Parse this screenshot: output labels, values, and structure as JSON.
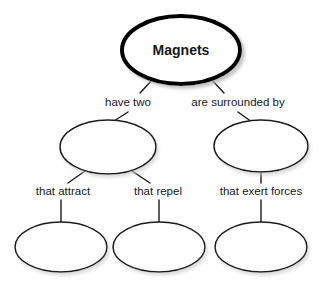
{
  "diagram": {
    "type": "concept-map",
    "background_color": "#ffffff",
    "stroke_color": "#1a1a1a",
    "text_color": "#17171b",
    "root": {
      "label": "Magnets",
      "shape": "ellipse",
      "emphasis": "thick-border-with-shadow",
      "cx": 181,
      "cy": 50,
      "rx": 59,
      "ry": 34
    },
    "link_labels": [
      {
        "id": "have-two",
        "text": "have two",
        "x": 128,
        "y": 103
      },
      {
        "id": "are-surrounded-by",
        "text": "are surrounded by",
        "x": 238,
        "y": 103
      },
      {
        "id": "that-attract",
        "text": "that attract",
        "x": 63,
        "y": 192
      },
      {
        "id": "that-repel",
        "text": "that repel",
        "x": 158,
        "y": 192
      },
      {
        "id": "that-exert-forces",
        "text": "that exert forces",
        "x": 261,
        "y": 192
      }
    ],
    "blank_nodes": [
      {
        "id": "blank-mid-left",
        "label": "",
        "cx": 108,
        "cy": 147,
        "rx": 48,
        "ry": 27
      },
      {
        "id": "blank-mid-right",
        "label": "",
        "cx": 261,
        "cy": 146,
        "rx": 47,
        "ry": 26
      },
      {
        "id": "blank-bottom-left",
        "label": "",
        "cx": 61,
        "cy": 247,
        "rx": 46,
        "ry": 25
      },
      {
        "id": "blank-bottom-middle",
        "label": "",
        "cx": 159,
        "cy": 247,
        "rx": 46,
        "ry": 25
      },
      {
        "id": "blank-bottom-right",
        "label": "",
        "cx": 261,
        "cy": 247,
        "rx": 46,
        "ry": 25
      }
    ],
    "connectors": [
      {
        "id": "root-to-have-two",
        "from": "root",
        "to": "have-two",
        "x1": 153,
        "y1": 79,
        "x2": 140,
        "y2": 93
      },
      {
        "id": "root-to-are-surrounded-by",
        "from": "root",
        "to": "are-surrounded-by",
        "x1": 211,
        "y1": 79,
        "x2": 224,
        "y2": 93
      },
      {
        "id": "have-two-to-blank-mid-left",
        "from": "have-two",
        "to": "blank-mid-left",
        "x1": 128,
        "y1": 112,
        "x2": 114,
        "y2": 121
      },
      {
        "id": "are-surrounded-by-to-blank-mid-right",
        "from": "are-surrounded-by",
        "to": "blank-mid-right",
        "x1": 238,
        "y1": 112,
        "x2": 252,
        "y2": 122
      },
      {
        "id": "blank-mid-left-to-that-attract",
        "from": "blank-mid-left",
        "to": "that-attract",
        "x1": 85,
        "y1": 171,
        "x2": 68,
        "y2": 183
      },
      {
        "id": "blank-mid-left-to-that-repel",
        "from": "blank-mid-left",
        "to": "that-repel",
        "x1": 132,
        "y1": 171,
        "x2": 150,
        "y2": 183
      },
      {
        "id": "blank-mid-right-to-that-exert-forces",
        "from": "blank-mid-right",
        "to": "that-exert-forces",
        "x1": 261,
        "y1": 172,
        "x2": 261,
        "y2": 183
      },
      {
        "id": "that-attract-to-blank-bottom-left",
        "from": "that-attract",
        "to": "blank-bottom-left",
        "x1": 61,
        "y1": 200,
        "x2": 61,
        "y2": 222
      },
      {
        "id": "that-repel-to-blank-bottom-middle",
        "from": "that-repel",
        "to": "blank-bottom-middle",
        "x1": 159,
        "y1": 200,
        "x2": 159,
        "y2": 222
      },
      {
        "id": "that-exert-forces-to-blank-bottom-right",
        "from": "that-exert-forces",
        "to": "blank-bottom-right",
        "x1": 261,
        "y1": 200,
        "x2": 261,
        "y2": 222
      }
    ]
  }
}
